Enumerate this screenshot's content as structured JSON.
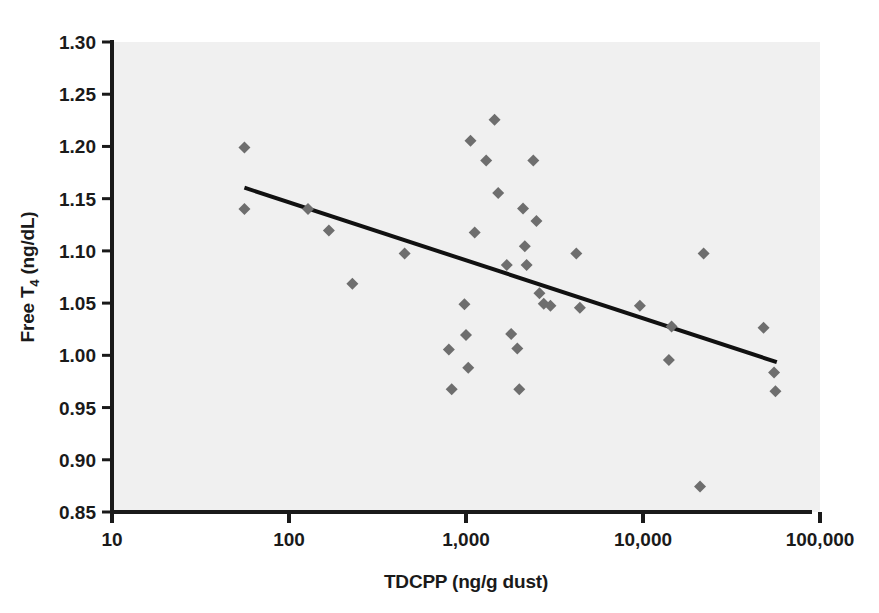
{
  "chart_data": {
    "type": "scatter",
    "title": "",
    "xlabel": "TDCPP (ng/g dust)",
    "ylabel": "Free T4 (ng/dL)",
    "ylabel_main": "Free T",
    "ylabel_subscript": "4",
    "ylabel_units": " (ng/dL)",
    "xscale": "log",
    "yscale": "linear",
    "xlim": [
      10,
      100000
    ],
    "ylim": [
      0.85,
      1.3
    ],
    "grid": false,
    "legend": null,
    "xticks": [
      10,
      100,
      1000,
      10000,
      100000
    ],
    "xtick_labels": [
      "10",
      "100",
      "1,000",
      "10,000",
      "100,000"
    ],
    "yticks": [
      0.85,
      0.9,
      0.95,
      1.0,
      1.05,
      1.1,
      1.15,
      1.2,
      1.25,
      1.3
    ],
    "ytick_labels": [
      "0.85",
      "0.90",
      "0.95",
      "1.00",
      "1.05",
      "1.10",
      "1.15",
      "1.20",
      "1.25",
      "1.30"
    ],
    "marker": "diamond",
    "marker_color": "#6e6e6e",
    "marker_size": 9,
    "plot_bg_color": "#f0f0f0",
    "axis_color": "#1a1a1a",
    "trendline": {
      "color": "#111111",
      "width": 4,
      "x_start": 56,
      "y_start": 1.1605,
      "x_end": 57000,
      "y_end": 0.9935
    },
    "points": [
      {
        "x": 56,
        "y": 1.199
      },
      {
        "x": 56,
        "y": 1.14
      },
      {
        "x": 128,
        "y": 1.14
      },
      {
        "x": 168,
        "y": 1.1195
      },
      {
        "x": 228,
        "y": 1.0685
      },
      {
        "x": 450,
        "y": 1.0975
      },
      {
        "x": 800,
        "y": 1.0055
      },
      {
        "x": 830,
        "y": 0.9675
      },
      {
        "x": 980,
        "y": 1.049
      },
      {
        "x": 1000,
        "y": 1.0195
      },
      {
        "x": 1030,
        "y": 0.988
      },
      {
        "x": 1060,
        "y": 1.2055
      },
      {
        "x": 1120,
        "y": 1.1175
      },
      {
        "x": 1300,
        "y": 1.1865
      },
      {
        "x": 1450,
        "y": 1.2255
      },
      {
        "x": 1520,
        "y": 1.1555
      },
      {
        "x": 1700,
        "y": 1.0865
      },
      {
        "x": 1800,
        "y": 1.0205
      },
      {
        "x": 1950,
        "y": 1.0065
      },
      {
        "x": 2000,
        "y": 0.9675
      },
      {
        "x": 2100,
        "y": 1.1405
      },
      {
        "x": 2150,
        "y": 1.1045
      },
      {
        "x": 2200,
        "y": 1.0865
      },
      {
        "x": 2400,
        "y": 1.1865
      },
      {
        "x": 2500,
        "y": 1.1285
      },
      {
        "x": 2600,
        "y": 1.0595
      },
      {
        "x": 2750,
        "y": 1.0495
      },
      {
        "x": 3000,
        "y": 1.0475
      },
      {
        "x": 4200,
        "y": 1.0975
      },
      {
        "x": 4400,
        "y": 1.0455
      },
      {
        "x": 9600,
        "y": 1.0475
      },
      {
        "x": 14000,
        "y": 0.9955
      },
      {
        "x": 14500,
        "y": 1.0275
      },
      {
        "x": 21000,
        "y": 0.8745
      },
      {
        "x": 22000,
        "y": 1.0975
      },
      {
        "x": 48000,
        "y": 1.0265
      },
      {
        "x": 55000,
        "y": 0.9835
      },
      {
        "x": 56000,
        "y": 0.9655
      }
    ]
  },
  "figure": {
    "plot_area": {
      "left": 112,
      "top": 42,
      "right": 820,
      "bottom": 512
    }
  }
}
